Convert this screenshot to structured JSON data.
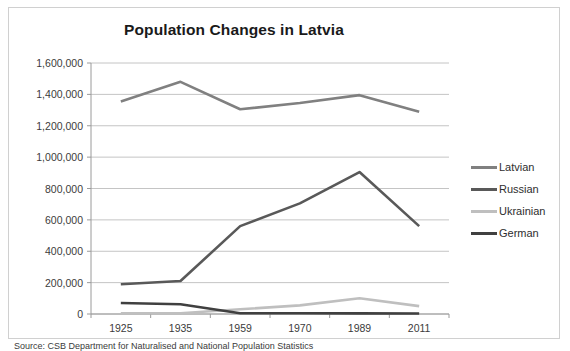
{
  "chart_data": {
    "type": "line",
    "title": "Population Changes in Latvia",
    "xlabel": "",
    "ylabel": "",
    "categories": [
      "1925",
      "1935",
      "1959",
      "1970",
      "1989",
      "2011"
    ],
    "ylim": [
      0,
      1600000
    ],
    "ytick_values": [
      0,
      200000,
      400000,
      600000,
      800000,
      1000000,
      1200000,
      1400000,
      1600000
    ],
    "ytick_labels": [
      "0",
      "200,000",
      "400,000",
      "600,000",
      "800,000",
      "1,000,000",
      "1,200,000",
      "1,400,000",
      "1,600,000"
    ],
    "grid": true,
    "legend_position": "right",
    "series": [
      {
        "name": "Latvian",
        "color": "#808080",
        "values": [
          1355000,
          1480000,
          1305000,
          1345000,
          1395000,
          1290000
        ]
      },
      {
        "name": "Russian",
        "color": "#595959",
        "values": [
          190000,
          210000,
          560000,
          705000,
          905000,
          560000
        ]
      },
      {
        "name": "Ukrainian",
        "color": "#bfbfbf",
        "values": [
          5000,
          5000,
          30000,
          55000,
          100000,
          50000
        ]
      },
      {
        "name": "German",
        "color": "#404040",
        "values": [
          70000,
          62000,
          5000,
          5000,
          4000,
          3000
        ]
      }
    ]
  },
  "caption": {
    "text": "Source: CSB Department for Naturalised and National Population Statistics"
  }
}
